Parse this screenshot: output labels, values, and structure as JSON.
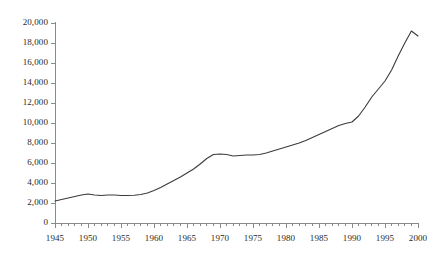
{
  "chart_data": {
    "type": "line",
    "title": "",
    "subtitle": "",
    "xlabel": "",
    "ylabel": "",
    "xlim": [
      1945,
      2000
    ],
    "ylim": [
      0,
      20000
    ],
    "grid": false,
    "legend": false,
    "legend_position": "none",
    "line_color": "#3b3b3b",
    "axis_color": "#8a8a8a",
    "background_color": "#ffffff",
    "x_tick_labels": [
      "1945",
      "1950",
      "1955",
      "1960",
      "1965",
      "1970",
      "1975",
      "1980",
      "1985",
      "1990",
      "1995",
      "2000"
    ],
    "x_tick_values": [
      1945,
      1950,
      1955,
      1960,
      1965,
      1970,
      1975,
      1980,
      1985,
      1990,
      1995,
      2000
    ],
    "x_minor_tick_interval": 1,
    "y_tick_labels": [
      "0",
      "2,000",
      "4,000",
      "6,000",
      "8,000",
      "10,000",
      "12,000",
      "14,000",
      "16,000",
      "18,000",
      "20,000"
    ],
    "y_tick_values": [
      0,
      2000,
      4000,
      6000,
      8000,
      10000,
      12000,
      14000,
      16000,
      18000,
      20000
    ],
    "x": [
      1945,
      1946,
      1947,
      1948,
      1949,
      1950,
      1951,
      1952,
      1953,
      1954,
      1955,
      1956,
      1957,
      1958,
      1959,
      1960,
      1961,
      1962,
      1963,
      1964,
      1965,
      1966,
      1967,
      1968,
      1969,
      1970,
      1971,
      1972,
      1973,
      1974,
      1975,
      1976,
      1977,
      1978,
      1979,
      1980,
      1981,
      1982,
      1983,
      1984,
      1985,
      1986,
      1987,
      1988,
      1989,
      1990,
      1991,
      1992,
      1993,
      1994,
      1995,
      1996,
      1997,
      1998,
      1999,
      2000
    ],
    "values": [
      2200,
      2350,
      2500,
      2650,
      2800,
      2900,
      2800,
      2750,
      2800,
      2800,
      2750,
      2750,
      2780,
      2850,
      3000,
      3250,
      3550,
      3900,
      4250,
      4600,
      5000,
      5400,
      5900,
      6450,
      6850,
      6900,
      6850,
      6700,
      6750,
      6800,
      6800,
      6850,
      7000,
      7200,
      7400,
      7600,
      7800,
      8000,
      8250,
      8550,
      8850,
      9150,
      9450,
      9750,
      9950,
      10100,
      10700,
      11600,
      12600,
      13400,
      14200,
      15300,
      16700,
      18000,
      19200,
      18700
    ],
    "series": [
      {
        "name": "series-1",
        "values": [
          2200,
          2350,
          2500,
          2650,
          2800,
          2900,
          2800,
          2750,
          2800,
          2800,
          2750,
          2750,
          2780,
          2850,
          3000,
          3250,
          3550,
          3900,
          4250,
          4600,
          5000,
          5400,
          5900,
          6450,
          6850,
          6900,
          6850,
          6700,
          6750,
          6800,
          6800,
          6850,
          7000,
          7200,
          7400,
          7600,
          7800,
          8000,
          8250,
          8550,
          8850,
          9150,
          9450,
          9750,
          9950,
          10100,
          10700,
          11600,
          12600,
          13400,
          14200,
          15300,
          16700,
          18000,
          19200,
          18700
        ]
      }
    ]
  }
}
